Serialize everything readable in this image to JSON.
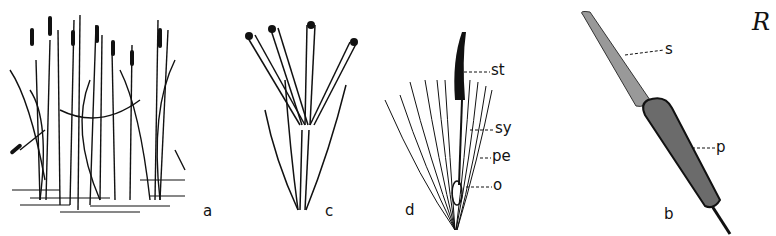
{
  "figure": {
    "panels": [
      {
        "id": "a",
        "label": "a",
        "depicts": "stand of cattail plants growing in water"
      },
      {
        "id": "c",
        "label": "c",
        "depicts": "staminate flower with four stamens"
      },
      {
        "id": "d",
        "label": "d",
        "depicts": "pistillate flower with hairs",
        "parts": [
          {
            "abbr": "st",
            "meaning": "stigma"
          },
          {
            "abbr": "sy",
            "meaning": "style"
          },
          {
            "abbr": "pe",
            "meaning": "perianth hairs"
          },
          {
            "abbr": "o",
            "meaning": "ovary"
          }
        ]
      },
      {
        "id": "b",
        "label": "b",
        "depicts": "cattail inflorescence spike",
        "parts": [
          {
            "abbr": "s",
            "meaning": "staminate part"
          },
          {
            "abbr": "p",
            "meaning": "pistillate part"
          }
        ]
      }
    ],
    "corner_mark": "R"
  },
  "colors": {
    "ink": "#111111",
    "background": "#ffffff",
    "spike": "#6b6b6b"
  }
}
